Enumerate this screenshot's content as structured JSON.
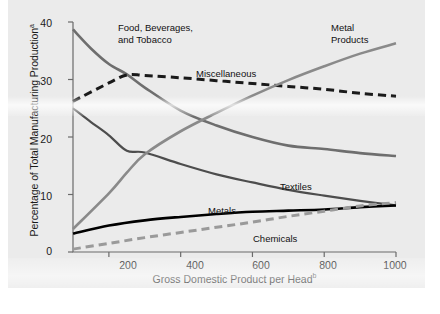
{
  "chart_data": {
    "type": "line",
    "title": "",
    "xlabel": "Gross Domestic Product per Head",
    "xlabel_superscript": "b",
    "ylabel": "Percentage of Total Manufacturing Production",
    "ylabel_superscript": "a",
    "xlim": [
      100,
      1000
    ],
    "ylim": [
      0,
      40
    ],
    "xticks": [
      200,
      400,
      600,
      800,
      1000
    ],
    "yticks": [
      0,
      10,
      20,
      30,
      40
    ],
    "grid": false,
    "legend_position": "inline-annotations",
    "series": [
      {
        "name": "Food, Beverages, and Tobacco",
        "color": "#6e6e6e",
        "style": "solid",
        "width": 2.6,
        "points": [
          [
            100,
            38.7
          ],
          [
            150,
            35.4
          ],
          [
            200,
            32.7
          ],
          [
            250,
            30.9
          ],
          [
            300,
            28.6
          ],
          [
            400,
            24.6
          ],
          [
            500,
            22.0
          ],
          [
            600,
            20.0
          ],
          [
            700,
            18.5
          ],
          [
            800,
            17.9
          ],
          [
            900,
            17.2
          ],
          [
            1000,
            16.7
          ]
        ]
      },
      {
        "name": "Miscellaneous",
        "color": "#1a1a1a",
        "style": "dashed",
        "width": 3.0,
        "points": [
          [
            100,
            26.2
          ],
          [
            200,
            29.4
          ],
          [
            250,
            30.8
          ],
          [
            300,
            30.7
          ],
          [
            400,
            30.3
          ],
          [
            500,
            29.8
          ],
          [
            600,
            29.3
          ],
          [
            700,
            28.8
          ],
          [
            800,
            28.3
          ],
          [
            900,
            27.6
          ],
          [
            1000,
            27.1
          ]
        ]
      },
      {
        "name": "Textiles",
        "color": "#4d4d4d",
        "style": "solid",
        "width": 2.2,
        "points": [
          [
            100,
            25.0
          ],
          [
            150,
            22.6
          ],
          [
            200,
            20.3
          ],
          [
            250,
            17.6
          ],
          [
            300,
            17.3
          ],
          [
            400,
            15.3
          ],
          [
            500,
            13.5
          ],
          [
            600,
            12.1
          ],
          [
            700,
            10.8
          ],
          [
            800,
            9.8
          ],
          [
            900,
            8.9
          ],
          [
            1000,
            8.1
          ]
        ]
      },
      {
        "name": "Metal Products",
        "color": "#8a8a8a",
        "style": "solid",
        "width": 2.6,
        "points": [
          [
            100,
            4.0
          ],
          [
            200,
            10.2
          ],
          [
            250,
            13.8
          ],
          [
            300,
            17.0
          ],
          [
            400,
            21.0
          ],
          [
            500,
            24.2
          ],
          [
            600,
            27.2
          ],
          [
            700,
            29.9
          ],
          [
            800,
            32.3
          ],
          [
            900,
            34.5
          ],
          [
            1000,
            36.3
          ]
        ]
      },
      {
        "name": "Metals",
        "color": "#000000",
        "style": "solid",
        "width": 2.6,
        "points": [
          [
            100,
            3.2
          ],
          [
            200,
            4.6
          ],
          [
            300,
            5.5
          ],
          [
            400,
            6.1
          ],
          [
            500,
            6.6
          ],
          [
            600,
            7.0
          ],
          [
            700,
            7.2
          ],
          [
            800,
            7.4
          ],
          [
            900,
            7.8
          ],
          [
            1000,
            8.1
          ]
        ]
      },
      {
        "name": "Chemicals",
        "color": "#9a9a9a",
        "style": "dashed",
        "width": 3.0,
        "points": [
          [
            100,
            0.5
          ],
          [
            200,
            1.5
          ],
          [
            300,
            2.5
          ],
          [
            400,
            3.4
          ],
          [
            500,
            4.3
          ],
          [
            600,
            5.2
          ],
          [
            700,
            6.2
          ],
          [
            800,
            7.1
          ],
          [
            900,
            8.0
          ],
          [
            1000,
            8.6
          ]
        ]
      }
    ],
    "annotations": [
      {
        "name": "food-beverages-tobacco",
        "text": "Food, Beverages,\nand Tobacco",
        "x": 118,
        "y": 22
      },
      {
        "name": "miscellaneous",
        "text": "Miscellaneous",
        "x": 196,
        "y": 68
      },
      {
        "name": "metal-products",
        "text": "Metal\nProducts",
        "x": 331,
        "y": 22
      },
      {
        "name": "textiles",
        "text": "Textiles",
        "x": 280,
        "y": 181
      },
      {
        "name": "metals",
        "text": "Metals",
        "x": 208,
        "y": 205
      },
      {
        "name": "chemicals",
        "text": "Chemicals",
        "x": 253,
        "y": 233
      }
    ]
  },
  "axes": {
    "y_tick_labels": [
      "40",
      "30",
      "20",
      "10",
      "0"
    ],
    "x_tick_labels": [
      "200",
      "400",
      "600",
      "800",
      "1000"
    ],
    "y_title": "Percentage of Total Manufacturing Production",
    "y_title_sup": "a",
    "x_title": "Gross Domestic Product per Head",
    "x_title_sup": "b"
  },
  "colors": {
    "panel_background": "#ebebeb",
    "axis": "#6b6b6b",
    "text": "#1a1a1a"
  }
}
